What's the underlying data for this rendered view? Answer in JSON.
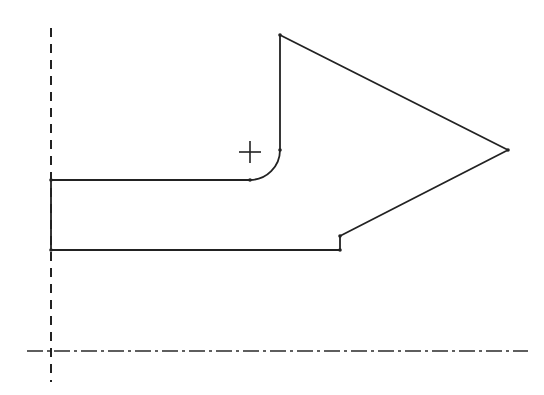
{
  "diagram": {
    "type": "cad-sketch",
    "colors": {
      "background": "#ffffff",
      "line": "#222222"
    },
    "axes": {
      "vertical": {
        "style": "dashed",
        "x": 51,
        "y1": 28,
        "y2": 382
      },
      "horizontal": {
        "style": "center-line",
        "y": 351,
        "x1": 27,
        "x2": 528
      }
    },
    "profile": {
      "vertices": [
        {
          "id": "p1",
          "x": 51,
          "y": 180
        },
        {
          "id": "p2",
          "x": 250,
          "y": 180
        },
        {
          "id": "p3",
          "x": 280,
          "y": 150
        },
        {
          "id": "p4",
          "x": 280,
          "y": 35
        },
        {
          "id": "p5",
          "x": 508,
          "y": 150
        },
        {
          "id": "p6",
          "x": 340,
          "y": 236
        },
        {
          "id": "p7",
          "x": 340,
          "y": 250
        },
        {
          "id": "p8",
          "x": 51,
          "y": 250
        }
      ],
      "fillet": {
        "from": "p2",
        "to": "p3",
        "radius": 30
      }
    },
    "cursor": {
      "symbol": "crosshair",
      "x": 250,
      "y": 152,
      "size": 11
    }
  }
}
